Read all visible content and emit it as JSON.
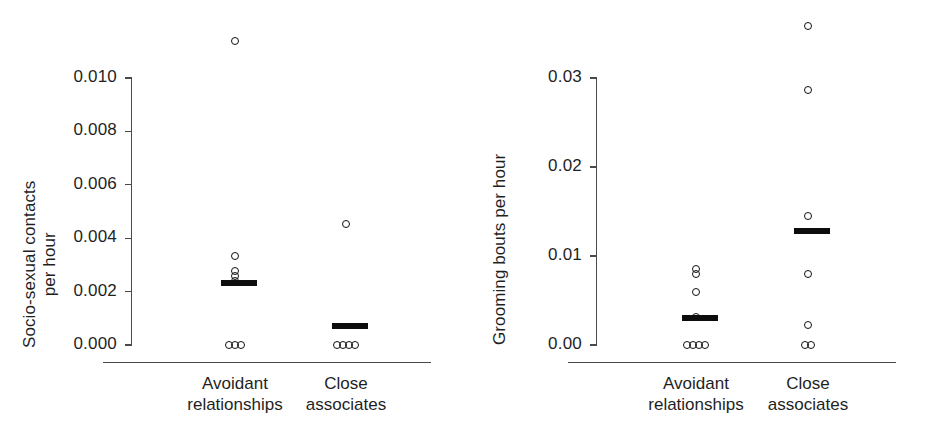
{
  "figure": {
    "background": "#ffffff",
    "marker_color": "#111111",
    "mean_bar_color": "#0d0d0d",
    "axis_color": "#4a4a4a",
    "text_color": "#1f1f1f"
  },
  "chart_data": [
    {
      "type": "scatter",
      "panel": "left",
      "title": "",
      "xlabel": "",
      "ylabel_lines": [
        "Socio-sexual contacts",
        "per hour"
      ],
      "ylabel": "Socio-sexual contacts per hour",
      "ylim": [
        0.0,
        0.0122
      ],
      "yticks": [
        0.0,
        0.002,
        0.004,
        0.006,
        0.008,
        0.01
      ],
      "ytick_labels": [
        "0.000",
        "0.002",
        "0.004",
        "0.006",
        "0.008",
        "0.010"
      ],
      "grid": false,
      "legend": "none",
      "categories": [
        "Avoidant relationships",
        "Close associates"
      ],
      "category_label_lines": [
        [
          "Avoidant",
          "relationships"
        ],
        [
          "Close",
          "associates"
        ]
      ],
      "groups": [
        {
          "name": "Avoidant relationships",
          "mean": 0.00232,
          "points": [
            0.0114,
            0.00333,
            0.00277,
            0.00258,
            0.0024,
            0.0,
            0.0,
            0.0
          ]
        },
        {
          "name": "Close associates",
          "mean": 0.0007,
          "points": [
            0.00452,
            0.0,
            0.0,
            0.0,
            0.0
          ]
        }
      ]
    },
    {
      "type": "scatter",
      "panel": "right",
      "title": "",
      "xlabel": "",
      "ylabel_lines": [
        "Grooming bouts per hour"
      ],
      "ylabel": "Grooming bouts per hour",
      "ylim": [
        0.0,
        0.0365
      ],
      "yticks": [
        0.0,
        0.01,
        0.02,
        0.03
      ],
      "ytick_labels": [
        "0.00",
        "0.01",
        "0.02",
        "0.03"
      ],
      "grid": false,
      "legend": "none",
      "categories": [
        "Avoidant relationships",
        "Close associates"
      ],
      "category_label_lines": [
        [
          "Avoidant",
          "relationships"
        ],
        [
          "Close",
          "associates"
        ]
      ],
      "groups": [
        {
          "name": "Avoidant relationships",
          "mean": 0.003,
          "points": [
            0.00855,
            0.008,
            0.006,
            0.0032,
            0.0,
            0.0,
            0.0,
            0.0
          ]
        },
        {
          "name": "Close associates",
          "mean": 0.0128,
          "points": [
            0.0358,
            0.0286,
            0.0145,
            0.008,
            0.0023,
            0.0,
            0.0
          ]
        }
      ]
    }
  ]
}
